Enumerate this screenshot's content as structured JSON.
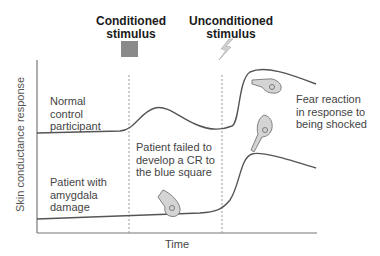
{
  "header": {
    "conditioned": "Conditioned stimulus",
    "conditioned_line1": "Conditioned",
    "conditioned_line2": "stimulus",
    "unconditioned_line1": "Unconditioned",
    "unconditioned_line2": "stimulus"
  },
  "icons": {
    "conditioned_stimulus": "gray-square",
    "unconditioned_stimulus": "lightning-bolt"
  },
  "axes": {
    "y_label": "Skin conductance response",
    "x_label": "Time"
  },
  "labels": {
    "normal": [
      "Normal",
      "control",
      "participant"
    ],
    "amygdala": [
      "Patient with",
      "amygdala",
      "damage"
    ],
    "failed": [
      "Patient failed to",
      "develop a CR to",
      "the blue square"
    ],
    "fear": [
      "Fear reaction",
      "in response to",
      "being shocked"
    ]
  },
  "colors": {
    "stimulus_square": "#8a8a8a",
    "curve": "#555555",
    "axis": "#777777",
    "dashed": "#999999",
    "hand_fill": "#c8c8c8"
  }
}
